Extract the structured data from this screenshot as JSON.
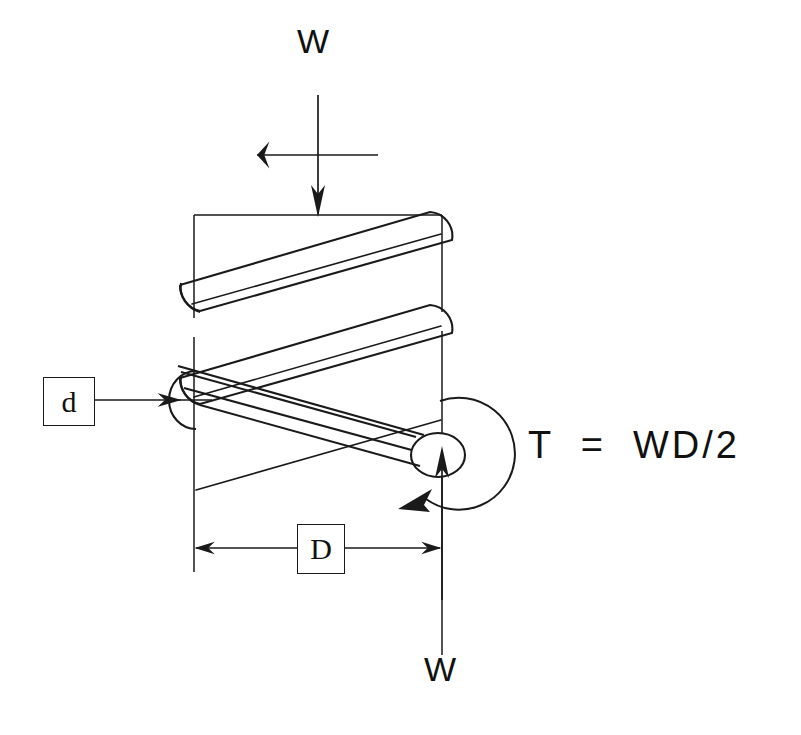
{
  "figure": {
    "type": "engineering-diagram",
    "background_color": "#ffffff",
    "line_color": "#1a1a1a"
  },
  "labels": {
    "load_top": "W",
    "load_bottom": "W",
    "torque_equation": "T  =  WD/2",
    "wire_diameter": "d",
    "coil_diameter": "D"
  },
  "annotations": {
    "force_arrow_top": "downward-force-arrow",
    "force_arrow_bottom": "upward-force-arrow",
    "torque_arc": "clockwise-torque-arc",
    "leader_arrow_wire": "leader-arrow-to-wire-section",
    "dimension_line": "coil-diameter-dimension-line"
  },
  "geometry": {
    "left_centerline_x": 194,
    "right_centerline_x": 442,
    "top_rule_y": 215,
    "dimension_line_y": 548,
    "coil_count": 3
  }
}
